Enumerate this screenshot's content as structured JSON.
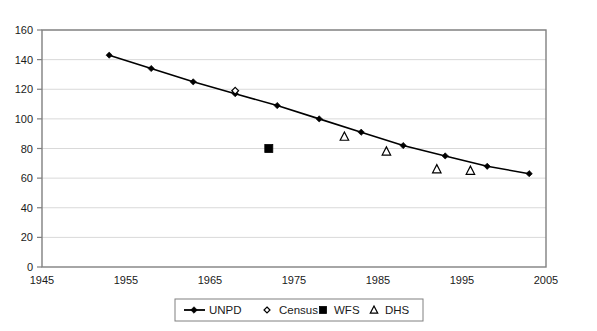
{
  "chart_data": {
    "type": "line",
    "title": "",
    "subtitle": "",
    "xlabel": "",
    "ylabel": "",
    "xlim": [
      1945,
      2005
    ],
    "ylim": [
      0,
      160
    ],
    "xticks": [
      "1945",
      "1955",
      "1965",
      "1975",
      "1985",
      "1995",
      "2005"
    ],
    "yticks": [
      "0",
      "20",
      "40",
      "60",
      "80",
      "100",
      "120",
      "140",
      "160"
    ],
    "grid": true,
    "grid_axis": "y",
    "legend_position": "bottom",
    "plot_border": true,
    "series": [
      {
        "name": "UNPD",
        "type": "line",
        "marker": "filled-diamond",
        "color": "#000000",
        "points": [
          {
            "x": 1953,
            "y": 143
          },
          {
            "x": 1958,
            "y": 134
          },
          {
            "x": 1963,
            "y": 125
          },
          {
            "x": 1968,
            "y": 117
          },
          {
            "x": 1973,
            "y": 109
          },
          {
            "x": 1978,
            "y": 100
          },
          {
            "x": 1983,
            "y": 91
          },
          {
            "x": 1988,
            "y": 82
          },
          {
            "x": 1993,
            "y": 75
          },
          {
            "x": 1998,
            "y": 68
          },
          {
            "x": 2003,
            "y": 63
          }
        ]
      },
      {
        "name": "Census",
        "type": "scatter",
        "marker": "open-diamond",
        "color": "#000000",
        "points": [
          {
            "x": 1968,
            "y": 119
          }
        ]
      },
      {
        "name": "WFS",
        "type": "scatter",
        "marker": "filled-square",
        "color": "#000000",
        "points": [
          {
            "x": 1972,
            "y": 80
          }
        ]
      },
      {
        "name": "DHS",
        "type": "scatter",
        "marker": "open-triangle",
        "color": "#000000",
        "points": [
          {
            "x": 1981,
            "y": 88
          },
          {
            "x": 1986,
            "y": 78
          },
          {
            "x": 1992,
            "y": 66
          },
          {
            "x": 1996,
            "y": 65
          }
        ]
      }
    ]
  },
  "legend": {
    "entries": [
      {
        "label": "UNPD",
        "marker": "line-diamond"
      },
      {
        "label": "Census",
        "marker": "open-diamond"
      },
      {
        "label": "WFS",
        "marker": "filled-square"
      },
      {
        "label": "DHS",
        "marker": "open-triangle"
      }
    ]
  },
  "colors": {
    "series": "#000000",
    "grid": "#d9d9d9",
    "border": "#808080",
    "background": "#ffffff"
  }
}
